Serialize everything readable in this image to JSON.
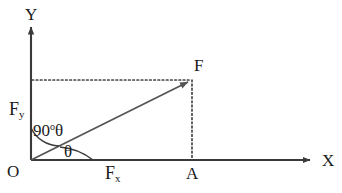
{
  "figure": {
    "type": "vector-components-diagram",
    "background_color": "#ffffff",
    "line_color": "#555555",
    "axis_color": "#3a3a3a",
    "text_color": "#1a1a1a"
  },
  "axes": {
    "y_label": "Y",
    "x_label": "X",
    "origin_label": "O"
  },
  "points": {
    "origin": "O",
    "foot": "A",
    "tip": "F"
  },
  "components": {
    "vertical": {
      "symbol": "F",
      "subscript": "y"
    },
    "horizontal": {
      "symbol": "F",
      "subscript": "x"
    }
  },
  "angles": {
    "from_y_axis": {
      "value": "90",
      "degree_symbol": "o",
      "theta": "θ"
    },
    "from_x_axis": {
      "theta": "θ"
    }
  },
  "geometry": {
    "origin_x": 31,
    "origin_y": 160,
    "tip_x": 192,
    "tip_y": 80,
    "x_axis_end": 312,
    "y_axis_top": 25
  }
}
